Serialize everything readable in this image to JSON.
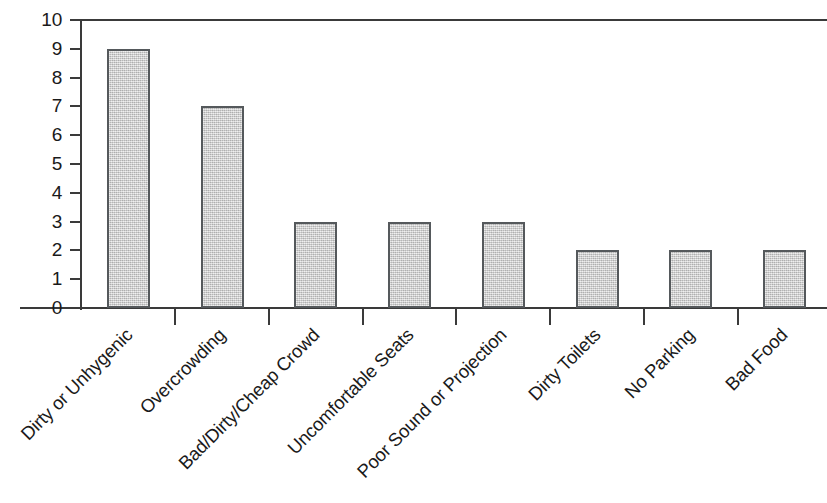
{
  "chart_data": {
    "type": "bar",
    "title": "",
    "subtitle": "",
    "xlabel": "",
    "ylabel": "",
    "ylim": [
      0,
      10
    ],
    "yticks": [
      0,
      1,
      2,
      3,
      4,
      5,
      6,
      7,
      8,
      9,
      10
    ],
    "ytick_labels": [
      "0",
      "1",
      "2",
      "3",
      "4",
      "5",
      "6",
      "7",
      "8",
      "9",
      "10"
    ],
    "grid": false,
    "legend": null,
    "bar_fill_color": "#c9c9c9",
    "bar_edge_color": "#55595c",
    "axis_color": "#3a3a3a",
    "background_color": "#ffffff",
    "categories": [
      "Dirty or Unhygenic",
      "Overcrowding",
      "Bad/Dirty/Cheap Crowd",
      "Uncomfortable Seats",
      "Poor Sound or Projection",
      "Dirty Toilets",
      "No Parking",
      "Bad Food"
    ],
    "values": [
      9,
      7,
      3,
      3,
      3,
      2,
      2,
      2
    ]
  }
}
